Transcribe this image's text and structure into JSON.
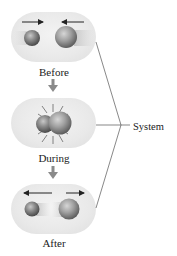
{
  "diagram": {
    "panels": [
      {
        "id": "before",
        "label": "Before",
        "arrows": "toward-each-other"
      },
      {
        "id": "during",
        "label": "During",
        "arrows": "collision-burst"
      },
      {
        "id": "after",
        "label": "After",
        "arrows": "away-from-each-other"
      }
    ],
    "system_label": "System",
    "colors": {
      "panel_bg": "#e9e9e9",
      "ball": "#7a7a7a",
      "arrow": "#222222",
      "down_arrow": "#8a8a8a",
      "connector_line": "#555555"
    }
  }
}
